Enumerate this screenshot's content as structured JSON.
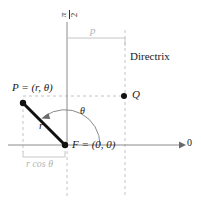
{
  "figure": {
    "labels": {
      "pi_numerator": "π",
      "pi_denominator": "2",
      "p": "p",
      "directrix": "Directrix",
      "point_P": "P = (r, θ)",
      "point_Q": "Q",
      "theta": "θ",
      "r": "r",
      "point_F": "F = (0, 0)",
      "r_cos_theta": "r cos θ",
      "polar_axis": "0"
    },
    "colors": {
      "ink": "#1a1a1a",
      "axis": "#7a7a7a",
      "dashed": "#b9b9c6",
      "gray_text": "#b3b3b3",
      "background": "#ffffff"
    },
    "geometry": {
      "origin_F": [
        65,
        145
      ],
      "point_P": [
        23,
        103
      ],
      "point_Q": [
        124,
        96
      ],
      "vertical_axis_x": 67,
      "horizontal_axis_y": 145,
      "directrix_x": 125,
      "p_bracket_y": 38,
      "rcos_bracket_y": 157,
      "axis_arrow_end_x": 183
    }
  }
}
